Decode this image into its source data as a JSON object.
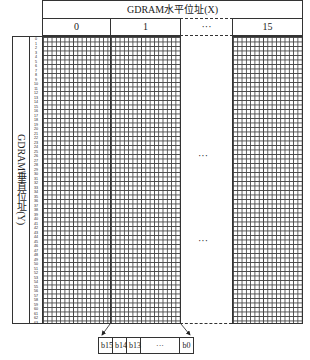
{
  "title": "GDRAM水平位址(X)",
  "columns": [
    "0",
    "1",
    "···",
    "15"
  ],
  "y_label": "GDRAM垂直位址(Y)",
  "row_numbers": [
    "0",
    "1",
    "2",
    "3",
    "4",
    "5",
    "6",
    "7",
    "8",
    "9",
    "10",
    "11",
    "12",
    "13",
    "14",
    "15",
    "16",
    "17",
    "18",
    "19",
    "20",
    "21",
    "22",
    "23",
    "24",
    "25",
    "26",
    "27",
    "28",
    "29",
    "30",
    "31",
    "32",
    "33",
    "34",
    "35",
    "36",
    "37",
    "38",
    "39",
    "40",
    "41",
    "42",
    "43",
    "44",
    "45",
    "46",
    "47",
    "48",
    "49",
    "50",
    "51",
    "52",
    "53",
    "54",
    "55",
    "56",
    "57",
    "58",
    "59",
    "60",
    "61",
    "62",
    "63"
  ],
  "middle_dots": [
    "···",
    "···"
  ],
  "bits": [
    "b15",
    "b14",
    "b13",
    "···",
    "b0"
  ]
}
